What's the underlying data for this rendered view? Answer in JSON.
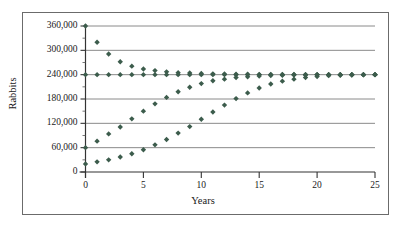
{
  "chart_data": {
    "type": "scatter",
    "title": "",
    "xlabel": "Years",
    "ylabel": "Rabbits",
    "xlim": [
      0,
      25
    ],
    "ylim": [
      0,
      360000
    ],
    "grid": true,
    "legend_position": "none",
    "x_ticks": [
      0,
      5,
      10,
      15,
      20,
      25
    ],
    "x_tick_labels": [
      "0",
      "5",
      "10",
      "15",
      "20",
      "25"
    ],
    "y_ticks": [
      0,
      60000,
      120000,
      180000,
      240000,
      300000,
      360000
    ],
    "y_tick_labels": [
      "0",
      "60,000",
      "120,000",
      "180,000",
      "240,000",
      "300,000",
      "360,000"
    ],
    "marker_color": "#3c5c4c",
    "carrying_capacity": 240000,
    "x": [
      0,
      1,
      2,
      3,
      4,
      5,
      6,
      7,
      8,
      9,
      10,
      11,
      12,
      13,
      14,
      15,
      16,
      17,
      18,
      19,
      20,
      21,
      22,
      23,
      24,
      25
    ],
    "series": [
      {
        "name": "Declining population",
        "initial_value": 360000,
        "values": [
          360000,
          320000,
          291000,
          272000,
          261000,
          254000,
          250000,
          247000,
          245000,
          244000,
          243000,
          242000,
          241500,
          241000,
          241000,
          240700,
          240500,
          240400,
          240300,
          240200,
          240200,
          240100,
          240100,
          240100,
          240000,
          240000
        ]
      },
      {
        "name": "Equilibrium population",
        "initial_value": 240000,
        "values": [
          240000,
          240000,
          240000,
          240000,
          240000,
          240000,
          240000,
          240000,
          240000,
          240000,
          240000,
          240000,
          240000,
          240000,
          240000,
          240000,
          240000,
          240000,
          240000,
          240000,
          240000,
          240000,
          240000,
          240000,
          240000,
          240000
        ]
      },
      {
        "name": "Growth from 60,000",
        "initial_value": 60000,
        "values": [
          60000,
          76000,
          94000,
          111000,
          131000,
          150000,
          168000,
          184000,
          198000,
          209000,
          218000,
          225000,
          229000,
          233000,
          235000,
          236500,
          238000,
          238500,
          239000,
          239300,
          239500,
          239700,
          239800,
          239900,
          240000,
          240000
        ]
      },
      {
        "name": "Growth from 20,000",
        "initial_value": 20000,
        "values": [
          20000,
          25000,
          30000,
          37000,
          45000,
          55000,
          67000,
          80000,
          96000,
          112000,
          130000,
          148000,
          165000,
          181000,
          195000,
          207000,
          217000,
          224000,
          229000,
          233000,
          235500,
          237500,
          238500,
          239200,
          239600,
          240000
        ]
      }
    ]
  },
  "axis": {
    "ylabel_text": "Rabbits",
    "xlabel_text": "Years"
  }
}
